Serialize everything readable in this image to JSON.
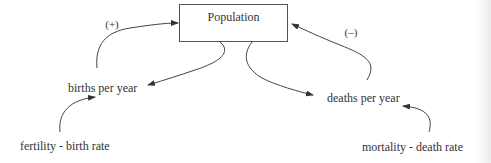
{
  "diagram": {
    "type": "causal-loop",
    "nodes": {
      "population": "Population",
      "births": "births per year",
      "deaths": "deaths per year",
      "fertility": "fertility - birth rate",
      "mortality": "mortality - death rate"
    },
    "polarities": {
      "births_to_population": "(+)",
      "deaths_to_population": "(–)"
    },
    "edges": [
      {
        "from": "population",
        "to": "births"
      },
      {
        "from": "births",
        "to": "population",
        "label": "(+)"
      },
      {
        "from": "population",
        "to": "deaths"
      },
      {
        "from": "deaths",
        "to": "population",
        "label": "(–)"
      },
      {
        "from": "fertility",
        "to": "births"
      },
      {
        "from": "mortality",
        "to": "deaths"
      }
    ],
    "colors": {
      "line": "#444444",
      "text": "#333333",
      "background": "#ffffff"
    }
  }
}
